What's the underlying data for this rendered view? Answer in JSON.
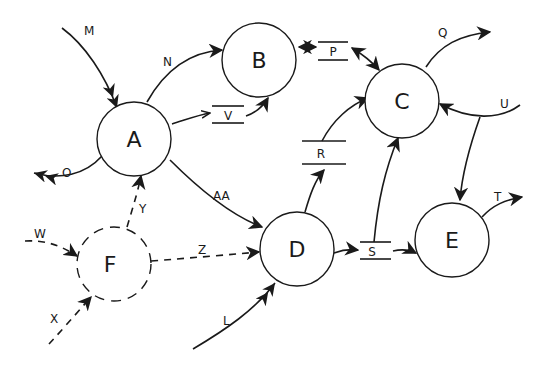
{
  "diagram": {
    "type": "data-flow-diagram",
    "colors": {
      "ink": "#1a1a1a",
      "background": "#ffffff"
    },
    "nodes": [
      {
        "id": "A",
        "label": "A",
        "style": "solid"
      },
      {
        "id": "B",
        "label": "B",
        "style": "solid"
      },
      {
        "id": "C",
        "label": "C",
        "style": "solid"
      },
      {
        "id": "D",
        "label": "D",
        "style": "solid"
      },
      {
        "id": "E",
        "label": "E",
        "style": "solid"
      },
      {
        "id": "F",
        "label": "F",
        "style": "dashed"
      }
    ],
    "stores": [
      {
        "id": "P",
        "label": "P"
      },
      {
        "id": "V",
        "label": "V"
      },
      {
        "id": "R",
        "label": "R"
      },
      {
        "id": "S",
        "label": "S"
      }
    ],
    "flows": [
      {
        "label": "M",
        "from": "external",
        "to": "A",
        "style": "solid"
      },
      {
        "label": "N",
        "from": "A",
        "to": "B",
        "style": "solid"
      },
      {
        "label": "O",
        "from": "A",
        "to": "external",
        "style": "solid"
      },
      {
        "label": "",
        "from": "A",
        "to": "V",
        "style": "solid"
      },
      {
        "label": "",
        "from": "V",
        "to": "B",
        "style": "solid"
      },
      {
        "label": "",
        "from": "B",
        "to": "P",
        "style": "solid",
        "bidirectional": true
      },
      {
        "label": "",
        "from": "P",
        "to": "C",
        "style": "solid",
        "bidirectional": true
      },
      {
        "label": "Q",
        "from": "C",
        "to": "external",
        "style": "solid"
      },
      {
        "label": "U",
        "from": "external",
        "to": "C",
        "style": "solid"
      },
      {
        "label": "",
        "from": "U",
        "to": "E",
        "style": "solid"
      },
      {
        "label": "AA",
        "from": "A",
        "to": "D",
        "style": "solid"
      },
      {
        "label": "",
        "from": "D",
        "to": "R",
        "style": "solid"
      },
      {
        "label": "",
        "from": "R",
        "to": "C",
        "style": "solid"
      },
      {
        "label": "",
        "from": "S",
        "to": "C",
        "style": "solid"
      },
      {
        "label": "",
        "from": "D",
        "to": "S",
        "style": "solid"
      },
      {
        "label": "",
        "from": "S",
        "to": "E",
        "style": "solid"
      },
      {
        "label": "T",
        "from": "E",
        "to": "external",
        "style": "solid"
      },
      {
        "label": "L",
        "from": "external",
        "to": "D",
        "style": "solid"
      },
      {
        "label": "W",
        "from": "external",
        "to": "F",
        "style": "dashed"
      },
      {
        "label": "X",
        "from": "external",
        "to": "F",
        "style": "dashed"
      },
      {
        "label": "Y",
        "from": "F",
        "to": "A",
        "style": "dashed"
      },
      {
        "label": "Z",
        "from": "F",
        "to": "D",
        "style": "dashed"
      }
    ],
    "labels": {
      "M": "M",
      "N": "N",
      "O": "O",
      "Q": "Q",
      "U": "U",
      "AA": "AA",
      "T": "T",
      "L": "L",
      "W": "W",
      "X": "X",
      "Y": "Y",
      "Z": "Z"
    }
  }
}
